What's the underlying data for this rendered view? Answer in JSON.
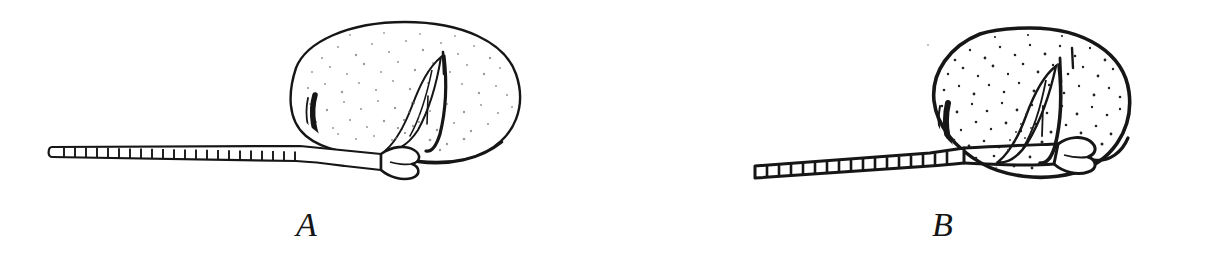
{
  "plate": {
    "background_color": "#ffffff",
    "ink_color": "#161616",
    "width": 1206,
    "height": 277,
    "type": "line-drawing-scientific-illustration",
    "subject": "two lateral-view insect antenna and body outline drawings",
    "panel_count": 2
  },
  "figures": [
    {
      "id": "A",
      "label": "A",
      "label_x": 310,
      "label_y": 230,
      "body": {
        "shape": "broad-oval",
        "center_x": 405,
        "center_y": 90,
        "radius_x": 115,
        "radius_y": 69,
        "outline_weight": "thin",
        "outline_color": "#161616",
        "stipple_density": "sparse",
        "stipple_color": "#9a9a9a",
        "stipple_count": 300,
        "top_y": 22,
        "bottom_y": 160,
        "left_x": 290,
        "right_x": 520
      },
      "antenna": {
        "segment_count": 22,
        "tip_shape": "rounded",
        "start_x": 48,
        "end_x": 300,
        "baseline_y": 152,
        "thickness_tip": 9,
        "thickness_base": 17,
        "tilt": "horizontal",
        "line_weight": "thin"
      },
      "marks": {
        "crescent_label": "dark-crescent-left-margin",
        "wing_label": "pointed-wing-structure",
        "joint_label": "bulbous-scape-pedicel-joint"
      }
    },
    {
      "id": "B",
      "label": "B",
      "label_x": 945,
      "label_y": 230,
      "body": {
        "shape": "round-oval",
        "center_x": 1030,
        "center_y": 101,
        "radius_x": 100,
        "radius_y": 73,
        "outline_weight": "thick",
        "outline_color": "#161616",
        "stipple_density": "dense",
        "stipple_color": "#232323",
        "stipple_count": 430,
        "top_y": 28,
        "bottom_y": 175,
        "left_x": 930,
        "right_x": 1130
      },
      "antenna": {
        "segment_count": 17,
        "tip_shape": "square",
        "start_x": 752,
        "end_x": 950,
        "baseline_y": 172,
        "thickness_tip": 11,
        "thickness_base": 18,
        "tilt": "slight-upward",
        "line_weight": "thick"
      },
      "marks": {
        "crescent_label": "dark-crescent-left-margin",
        "wing_label": "pointed-wing-structure",
        "joint_label": "bulbous-scape-pedicel-joint"
      }
    }
  ]
}
